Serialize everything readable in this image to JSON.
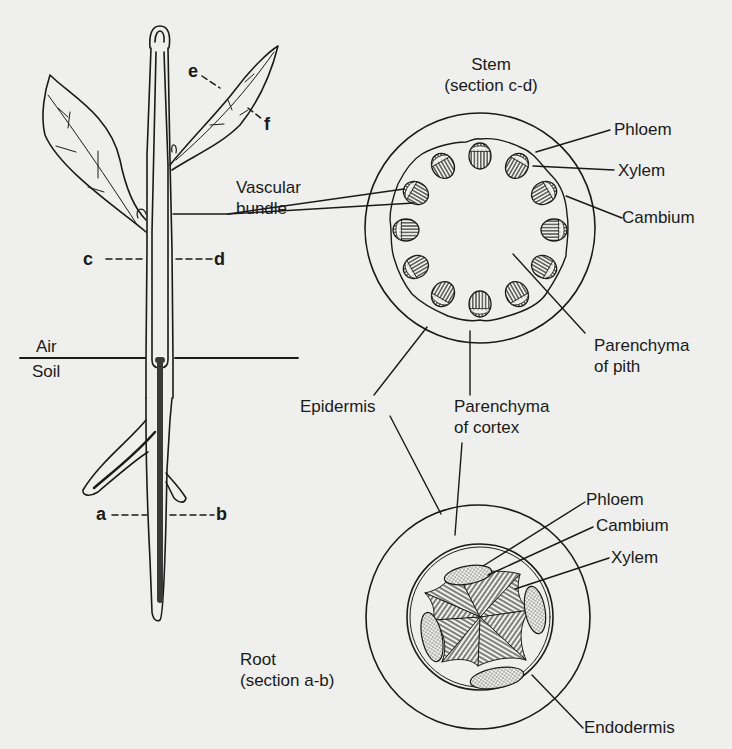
{
  "colors": {
    "background": "#efefed",
    "ink": "#1a1a1a",
    "root_vascular": "#3a3a3a"
  },
  "plant": {
    "ground_labels": {
      "air": "Air",
      "soil": "Soil"
    },
    "section_markers": {
      "stem_left": "c",
      "stem_right": "d",
      "root_left": "a",
      "root_right": "b",
      "leaf_top": "e",
      "leaf_bottom": "f"
    },
    "vascular_bundle_label": [
      "Vascular",
      "bundle"
    ]
  },
  "stem_section": {
    "title": "Stem",
    "subtitle": "(section c-d)",
    "bundle_count": 12,
    "labels": {
      "phloem": "Phloem",
      "xylem": "Xylem",
      "cambium": "Cambium",
      "pith": [
        "Parenchyma",
        "of pith"
      ]
    }
  },
  "shared_labels": {
    "epidermis": "Epidermis",
    "cortex": [
      "Parenchyma",
      "of cortex"
    ]
  },
  "root_section": {
    "title": "Root",
    "subtitle": "(section a-b)",
    "phloem_groups": 4,
    "xylem_arms": 4,
    "labels": {
      "phloem": "Phloem",
      "cambium": "Cambium",
      "xylem": "Xylem",
      "endodermis": "Endodermis"
    }
  }
}
